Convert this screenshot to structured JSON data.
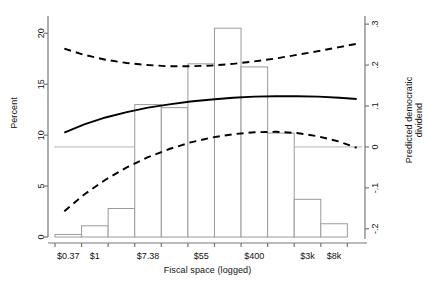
{
  "chart_data": {
    "type": "bar",
    "title": "",
    "subtitle": "",
    "xlabel": "Fiscal space (logged)",
    "ylabel": "Percent",
    "ylabel_right": "Predicted democratic dividend",
    "grid": false,
    "legend": "none",
    "ylim": [
      0,
      21.5
    ],
    "ylim_right": [
      -0.22,
      0.315
    ],
    "yticks": [
      0,
      5,
      10,
      15,
      20
    ],
    "ytick_labels": [
      "0",
      "5",
      "10",
      "15",
      "20"
    ],
    "yticks_right": [
      -0.2,
      -0.1,
      0,
      0.1,
      0.2,
      0.3
    ],
    "ytick_labels_right": [
      "-.2",
      "-.1",
      "0",
      ".1",
      ".2",
      ".3"
    ],
    "xtick_labels": [
      "$0.37",
      "$1",
      "$7.38",
      "$55",
      "$400",
      "$3k",
      "$8k"
    ],
    "xtick_positions": [
      1,
      2,
      4,
      6,
      8,
      10,
      11
    ],
    "xlim": [
      0.5,
      11.9
    ],
    "categories": [
      "$0.37",
      "$1",
      "$2.7",
      "$7.38",
      "$20",
      "$55",
      "$148",
      "$400",
      "$1.1k",
      "$3k",
      "$8k"
    ],
    "bar_centers": [
      1,
      2,
      3,
      4,
      5,
      6,
      7,
      8,
      9,
      10,
      11
    ],
    "values": [
      0.25,
      1.1,
      2.8,
      13.0,
      12.7,
      17.0,
      20.5,
      16.7,
      10.2,
      3.7,
      1.3
    ],
    "bar_fill": "#ffffff",
    "bar_stroke": "#9a9a9a",
    "zero_reference_line": {
      "value_right": 0.0,
      "color": "#b5b5b5"
    },
    "series": [
      {
        "name": "Predicted democratic dividend",
        "style": "solid",
        "color": "#000000",
        "axis": "right",
        "x": [
          0.85,
          1.6,
          2.4,
          3.2,
          4.0,
          4.8,
          5.6,
          6.4,
          7.2,
          8.0,
          8.8,
          9.6,
          10.4,
          11.2,
          11.85
        ],
        "values": [
          0.035,
          0.055,
          0.072,
          0.085,
          0.096,
          0.104,
          0.111,
          0.116,
          0.12,
          0.123,
          0.124,
          0.124,
          0.123,
          0.12,
          0.117
        ]
      },
      {
        "name": "Upper 95% confidence bound",
        "style": "dashed",
        "color": "#000000",
        "axis": "right",
        "x": [
          0.85,
          1.6,
          2.4,
          3.2,
          4.0,
          4.8,
          5.6,
          6.4,
          7.2,
          8.0,
          8.8,
          9.6,
          10.4,
          11.2,
          11.85
        ],
        "values": [
          0.24,
          0.225,
          0.213,
          0.205,
          0.2,
          0.197,
          0.197,
          0.199,
          0.203,
          0.209,
          0.216,
          0.225,
          0.234,
          0.244,
          0.252
        ]
      },
      {
        "name": "Lower 95% confidence bound",
        "style": "dashed",
        "color": "#000000",
        "axis": "right",
        "x": [
          0.85,
          1.6,
          2.4,
          3.2,
          4.0,
          4.8,
          5.6,
          6.4,
          7.2,
          8.0,
          8.8,
          9.6,
          10.4,
          11.2,
          11.85
        ],
        "values": [
          -0.157,
          -0.116,
          -0.08,
          -0.05,
          -0.025,
          -0.005,
          0.011,
          0.023,
          0.031,
          0.036,
          0.037,
          0.034,
          0.026,
          0.013,
          -0.002
        ]
      }
    ]
  }
}
